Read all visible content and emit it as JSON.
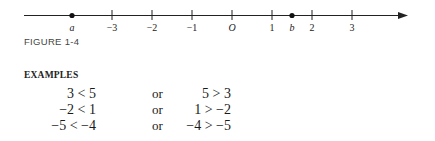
{
  "figure": {
    "label": "FIGURE 1-4",
    "number_line": {
      "ticks": [
        {
          "value": -3,
          "label": "−3"
        },
        {
          "value": -2,
          "label": "−2"
        },
        {
          "value": -1,
          "label": "−1"
        },
        {
          "value": 0,
          "label": "O"
        },
        {
          "value": 1,
          "label": "1"
        },
        {
          "value": 2,
          "label": "2"
        },
        {
          "value": 3,
          "label": "3"
        }
      ],
      "points": [
        {
          "name": "a",
          "value": -4
        },
        {
          "name": "b",
          "value": 1.5
        }
      ],
      "direction": "right-arrow"
    }
  },
  "examples": {
    "heading": "EXAMPLES",
    "rows": [
      {
        "left": "3 < 5",
        "connector": "or",
        "right": "5 > 3"
      },
      {
        "left": "−2 < 1",
        "connector": "or",
        "right": "1 > −2"
      },
      {
        "left": "−5 < −4",
        "connector": "or",
        "right": "−4 > −5"
      }
    ]
  }
}
